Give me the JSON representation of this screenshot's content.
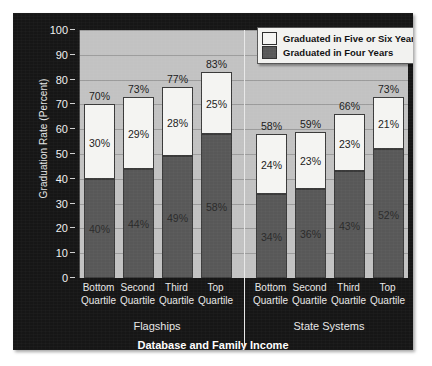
{
  "chart_data": {
    "type": "bar",
    "title": "Database and Family Income",
    "xlabel": "",
    "ylabel": "Graduation Rate (Percent)",
    "ylim": [
      0,
      100
    ],
    "ytick_labels": [
      "100",
      "90",
      "80",
      "70",
      "60",
      "50",
      "40",
      "30",
      "20",
      "10",
      "0"
    ],
    "ytick_values": [
      100,
      90,
      80,
      70,
      60,
      50,
      40,
      30,
      20,
      10,
      0
    ],
    "grid": true,
    "stacked": true,
    "legend_position": "top-right",
    "legend": [
      {
        "label": "Graduated in Five or Six Years",
        "color": "#f4f4f2"
      },
      {
        "label": "Graduated in Four Years",
        "color": "#585858"
      }
    ],
    "series": [
      {
        "name": "Graduated in Four Years",
        "color": "#585858",
        "values": [
          40,
          44,
          49,
          58,
          34,
          36,
          43,
          52
        ],
        "labels": [
          "40%",
          "44%",
          "49%",
          "58%",
          "34%",
          "36%",
          "43%",
          "52%"
        ]
      },
      {
        "name": "Graduated in Five or Six Years",
        "color": "#f4f4f2",
        "values": [
          30,
          29,
          28,
          25,
          24,
          23,
          23,
          21
        ],
        "labels": [
          "30%",
          "29%",
          "28%",
          "25%",
          "24%",
          "23%",
          "23%",
          "21%"
        ]
      }
    ],
    "totals": [
      70,
      73,
      77,
      83,
      58,
      59,
      66,
      73
    ],
    "total_labels": [
      "70%",
      "73%",
      "77%",
      "83%",
      "58%",
      "59%",
      "66%",
      "73%"
    ],
    "categories": [
      "Bottom Quartile",
      "Second Quartile",
      "Third Quartile",
      "Top Quartile",
      "Bottom Quartile",
      "Second Quartile",
      "Third Quartile",
      "Top Quartile"
    ],
    "category_lines": [
      [
        "Bottom",
        "Quartile"
      ],
      [
        "Second",
        "Quartile"
      ],
      [
        "Third",
        "Quartile"
      ],
      [
        "Top",
        "Quartile"
      ],
      [
        "Bottom",
        "Quartile"
      ],
      [
        "Second",
        "Quartile"
      ],
      [
        "Third",
        "Quartile"
      ],
      [
        "Top",
        "Quartile"
      ]
    ],
    "groups": [
      {
        "name": "Flagships",
        "indices": [
          0,
          1,
          2,
          3
        ]
      },
      {
        "name": "State Systems",
        "indices": [
          4,
          5,
          6,
          7
        ]
      }
    ],
    "colors": {
      "panel_background": "#161616",
      "plot_background": "#c2c2c2",
      "gridline": "#9b9b9b",
      "four_year_bar": "#585858",
      "five_six_year_bar": "#f4f4f2",
      "text_light": "#e8e8e8",
      "title_text": "#ffffff"
    }
  }
}
